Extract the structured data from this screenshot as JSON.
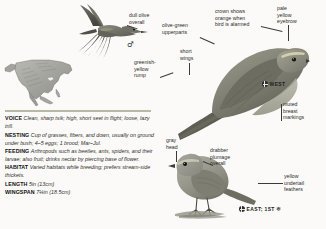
{
  "page": {
    "background_color": "#fbfaf8",
    "accent_rule_color": "#8d8f72"
  },
  "range_map": {
    "name": "north-america-range-map",
    "region": "North America"
  },
  "callouts": [
    {
      "id": "dull-olive-overall",
      "text": "dull olive\noverall"
    },
    {
      "id": "olive-green-upperparts",
      "text": "olive-green\nupperparts"
    },
    {
      "id": "crown-orange-alarmed",
      "text": "crown shows\norange when\nbird is alarmed"
    },
    {
      "id": "pale-yellow-eyebrow",
      "text": "pale\nyellow\neyebrow"
    },
    {
      "id": "greenish-yellow-rump",
      "text": "greenish-\nyellow\nrump"
    },
    {
      "id": "short-wings",
      "text": "short\nwings"
    },
    {
      "id": "muted-breast-markings",
      "text": "muted\nbreast\nmarkings"
    },
    {
      "id": "gray-head",
      "text": "gray\nhead"
    },
    {
      "id": "drabber-plumage-overall",
      "text": "drabber\nplumage\noverall"
    },
    {
      "id": "yellow-undertail-feathers",
      "text": "yellow\nundertail\nfeathers"
    }
  ],
  "badges": {
    "west": {
      "label": "WEST",
      "icon": "globe-icon"
    },
    "east_first": {
      "label": "EAST; 1ST",
      "icon": "globe-icon",
      "trailing_icon": "snowflake-icon"
    }
  },
  "symbols": {
    "male": "♂"
  },
  "species_entries": [
    {
      "term": "VOICE",
      "text": "Clean, sharp tsik; high, short seet in flight; loose, lazy trill."
    },
    {
      "term": "NESTING",
      "text": "Cup of grasses, fibers, and down, usually on ground under bush; 4–5 eggs; 1 brood; Mar–Jul."
    },
    {
      "term": "FEEDING",
      "text": "Arthropods such as beetles, ants, spiders, and their larvae; also fruit; drinks nectar by piercing base of flower."
    },
    {
      "term": "HABITAT",
      "text": "Varied habitats while breeding; prefers stream-side thickets."
    },
    {
      "term": "LENGTH",
      "text": "5in (13cm)"
    },
    {
      "term": "WINGSPAN",
      "text": "7¼in (18.5cm)"
    }
  ]
}
